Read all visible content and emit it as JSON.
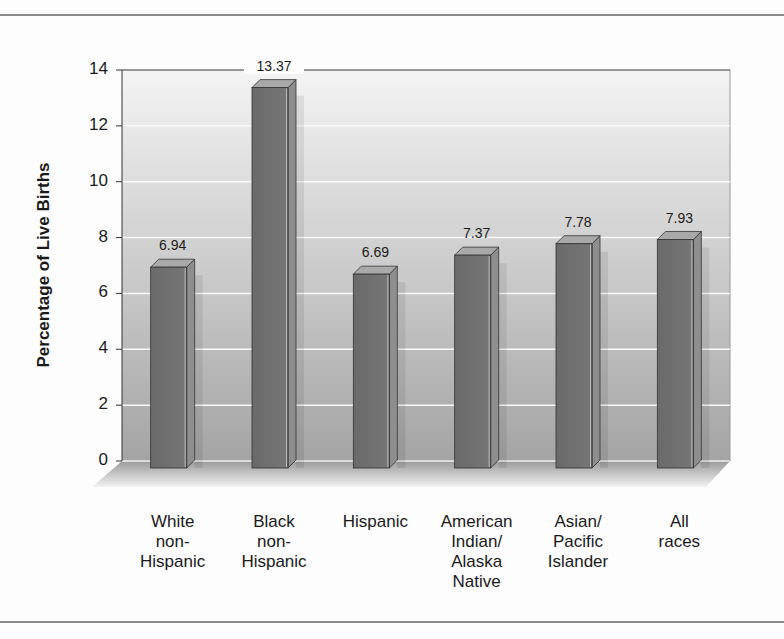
{
  "chart_data": {
    "type": "bar",
    "title": "",
    "xlabel": "",
    "ylabel": "Percentage of Live Births",
    "ylim": [
      0,
      14
    ],
    "yticks": [
      0,
      2,
      4,
      6,
      8,
      10,
      12,
      14
    ],
    "grid": true,
    "legend": null,
    "style": "3d-column",
    "categories": [
      "White non-Hispanic",
      "Black non-Hispanic",
      "Hispanic",
      "American Indian/Alaska Native",
      "Asian/Pacific Islander",
      "All races"
    ],
    "category_lines": [
      [
        "White",
        "non-",
        "Hispanic"
      ],
      [
        "Black",
        "non-",
        "Hispanic"
      ],
      [
        "Hispanic"
      ],
      [
        "American",
        "Indian/",
        "Alaska",
        "Native"
      ],
      [
        "Asian/",
        "Pacific",
        "Islander"
      ],
      [
        "All",
        "races"
      ]
    ],
    "values": [
      6.94,
      13.37,
      6.69,
      7.37,
      7.78,
      7.93
    ],
    "value_labels": [
      "6.94",
      "13.37",
      "6.69",
      "7.37",
      "7.78",
      "7.93"
    ]
  },
  "colors": {
    "bar_front": "#6f6f6f",
    "bar_side": "#8e8e8e",
    "bar_top": "#a9a9a9",
    "plot_bg_top": "#f0f0f0",
    "plot_bg_bottom": "#a6a6a6",
    "gridline": "#fafafa",
    "axis": "#333333",
    "rule": "#8a8a8a"
  }
}
